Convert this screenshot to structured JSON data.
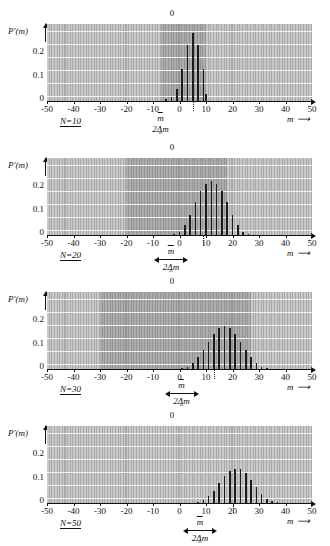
{
  "figure": {
    "y_axis_label": "P′(m)",
    "y_ticks": [
      "0.2",
      "0.1",
      "0"
    ],
    "x_ticks": [
      "-50",
      "-40",
      "-30",
      "-20",
      "-10",
      "0",
      "10",
      "20",
      "30",
      "40",
      "50"
    ],
    "x_axis_label": "m",
    "top_zero_label": "0",
    "mean_label": "m",
    "width_label": "2Δm",
    "width_label_tilde": "∿"
  },
  "chart_data": [
    {
      "type": "bar",
      "panel_label": "N=10",
      "title": "",
      "xlabel": "m",
      "ylabel": "P′(m)",
      "xlim": [
        -50,
        50
      ],
      "ylim": [
        0,
        0.28
      ],
      "xticks": [
        -50,
        -40,
        -30,
        -20,
        -10,
        0,
        10,
        20,
        30,
        40,
        50
      ],
      "yticks": [
        0,
        0.1,
        0.2
      ],
      "grid": true,
      "mean": 5,
      "band": [
        -7,
        10
      ],
      "x": [
        -5,
        -3,
        -1,
        1,
        3,
        5,
        7,
        9
      ],
      "values": [
        0.009,
        0.015,
        0.044,
        0.117,
        0.205,
        0.246,
        0.205,
        0.117,
        0.025
      ],
      "x_full": [
        -5,
        -3,
        -1,
        1,
        3,
        5,
        7,
        9,
        10
      ]
    },
    {
      "type": "bar",
      "panel_label": "N=20",
      "title": "",
      "xlabel": "m",
      "ylabel": "P′(m)",
      "xlim": [
        -50,
        50
      ],
      "ylim": [
        0,
        0.28
      ],
      "xticks": [
        -50,
        -40,
        -30,
        -20,
        -10,
        0,
        10,
        20,
        30,
        40,
        50
      ],
      "yticks": [
        0,
        0.1,
        0.2
      ],
      "grid": true,
      "mean": 9,
      "band": [
        -20,
        18
      ],
      "x": [
        -2,
        0,
        2,
        4,
        6,
        8,
        10,
        12,
        14,
        16,
        18
      ],
      "values": [
        0.005,
        0.012,
        0.037,
        0.074,
        0.12,
        0.16,
        0.185,
        0.196,
        0.185,
        0.16,
        0.12,
        0.074,
        0.037,
        0.012,
        0.005
      ]
    },
    {
      "type": "bar",
      "panel_label": "N=30",
      "title": "",
      "xlabel": "m",
      "ylabel": "P′(m)",
      "xlim": [
        -50,
        50
      ],
      "ylim": [
        0,
        0.28
      ],
      "xticks": [
        -50,
        -40,
        -30,
        -20,
        -10,
        0,
        10,
        20,
        30,
        40,
        50
      ],
      "yticks": [
        0,
        0.1,
        0.2
      ],
      "grid": true,
      "mean": 13,
      "band": [
        -30,
        27
      ],
      "x": [
        1,
        3,
        5,
        7,
        9,
        11,
        13,
        15,
        17,
        19,
        21,
        23,
        25
      ],
      "values": [
        0.004,
        0.009,
        0.021,
        0.042,
        0.07,
        0.1,
        0.128,
        0.148,
        0.155,
        0.148,
        0.128,
        0.1,
        0.07,
        0.042,
        0.021,
        0.009,
        0.004
      ]
    },
    {
      "type": "bar",
      "panel_label": "N=50",
      "title": "",
      "xlabel": "m",
      "ylabel": "P′(m)",
      "xlim": [
        -50,
        50
      ],
      "ylim": [
        0,
        0.28
      ],
      "xticks": [
        -50,
        -40,
        -30,
        -20,
        -10,
        0,
        10,
        20,
        30,
        40,
        50
      ],
      "yticks": [
        0,
        0.1,
        0.2
      ],
      "grid": true,
      "mean": 20,
      "band": [
        -50,
        50
      ],
      "x": [
        7,
        9,
        11,
        13,
        15,
        17,
        19,
        21,
        23,
        25,
        27,
        29,
        31,
        33
      ],
      "values": [
        0.004,
        0.011,
        0.024,
        0.045,
        0.072,
        0.098,
        0.116,
        0.124,
        0.122,
        0.108,
        0.085,
        0.059,
        0.034,
        0.016,
        0.007,
        0.003
      ]
    }
  ]
}
